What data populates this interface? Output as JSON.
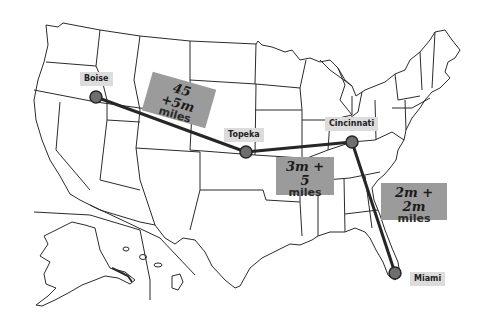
{
  "map": {
    "region": "United States",
    "cities": [
      {
        "name": "Boise",
        "x": 96,
        "y": 97
      },
      {
        "name": "Topeka",
        "x": 246,
        "y": 152
      },
      {
        "name": "Cincinnati",
        "x": 352,
        "y": 142
      },
      {
        "name": "Miami",
        "x": 395,
        "y": 273
      }
    ],
    "routes": [
      {
        "from": "Boise",
        "to": "Topeka",
        "expression": "45 +5m",
        "unit": "miles"
      },
      {
        "from": "Topeka",
        "to": "Cincinnati",
        "expression": "3m + 5",
        "unit": "miles"
      },
      {
        "from": "Cincinnati",
        "to": "Miami",
        "expression": "2m + 2m",
        "unit": "miles"
      }
    ],
    "colors": {
      "outline": "#2b2b2b",
      "route_line": "#262626",
      "city_dot": "#6e6e6e",
      "city_label_bg": "#dcdcdc",
      "distance_box_bg": "#9b9b9b"
    }
  }
}
